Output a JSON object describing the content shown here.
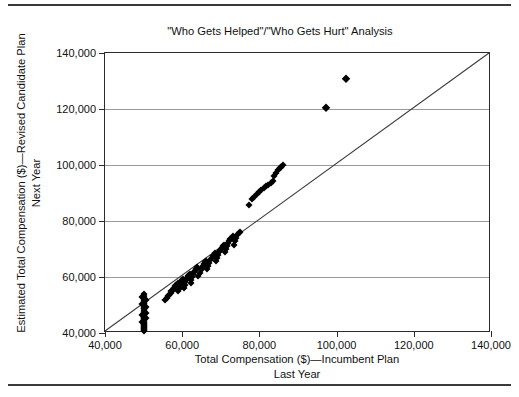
{
  "chart_title": {
    "line1": "\"Who Gets Helped\"/\"Who Gets Hurt\" Analysis",
    "line2": "(Based on the Coming Year's Projected Performance Distribution)"
  },
  "y_axis": {
    "title_line1": "Estimated Total Compensation ($)—Revised Candidate Plan",
    "title_line2": "Next Year",
    "tick_labels": [
      "140,000",
      "120,000",
      "100,000",
      "80,000",
      "60,000",
      "40,000"
    ],
    "min": 40000,
    "max": 140000
  },
  "x_axis": {
    "title_line1": "Total Compensation ($)—Incumbent Plan",
    "title_line2": "Last Year",
    "tick_labels": [
      "40,000",
      "60,000",
      "80,000",
      "100,000",
      "120,000",
      "140,000"
    ],
    "min": 40000,
    "max": 140000
  },
  "colors": {
    "marker": "#000000",
    "axis": "#2b2b2b",
    "gridline": "#9a9a9a",
    "reference_line": "#3a3a3a",
    "rule": "#3a3a3a",
    "background": "#ffffff"
  },
  "chart_data": {
    "type": "scatter",
    "title": "\"Who Gets Helped\"/\"Who Gets Hurt\" Analysis (Based on the Coming Year's Projected Performance Distribution)",
    "xlabel": "Total Compensation ($)—Incumbent Plan Last Year",
    "ylabel": "Estimated Total Compensation ($)—Revised Candidate Plan Next Year",
    "xlim": [
      40000,
      140000
    ],
    "ylim": [
      40000,
      140000
    ],
    "xticks": [
      40000,
      60000,
      80000,
      100000,
      120000,
      140000
    ],
    "yticks": [
      40000,
      60000,
      80000,
      100000,
      120000,
      140000
    ],
    "grid": "horizontal",
    "legend": "none",
    "annotations": [
      {
        "text": "reference line y = x drawn from (40,000, 40,000) to (140,000, 140,000)"
      }
    ],
    "reference_line": {
      "from": [
        40000,
        40000
      ],
      "to": [
        140000,
        140000
      ]
    },
    "series": [
      {
        "name": "Employees",
        "marker": "diamond",
        "points": [
          [
            50000,
            40600
          ],
          [
            50000,
            41000
          ],
          [
            50000,
            41400
          ],
          [
            50000,
            41800
          ],
          [
            50000,
            42100
          ],
          [
            50000,
            42500
          ],
          [
            50000,
            42900
          ],
          [
            50000,
            43300
          ],
          [
            50000,
            43700
          ],
          [
            50000,
            44100
          ],
          [
            50000,
            44500
          ],
          [
            50000,
            45000
          ],
          [
            50000,
            45400
          ],
          [
            50000,
            45800
          ],
          [
            50000,
            46300
          ],
          [
            50000,
            46800
          ],
          [
            50000,
            47300
          ],
          [
            50000,
            47900
          ],
          [
            50000,
            48400
          ],
          [
            50000,
            49000
          ],
          [
            50000,
            49600
          ],
          [
            50000,
            50200
          ],
          [
            50000,
            50800
          ],
          [
            50000,
            51400
          ],
          [
            50000,
            52000
          ],
          [
            50000,
            52600
          ],
          [
            50000,
            53200
          ],
          [
            50000,
            53800
          ],
          [
            50500,
            45200
          ],
          [
            50500,
            47000
          ],
          [
            50500,
            49400
          ],
          [
            50500,
            51800
          ],
          [
            49600,
            44000
          ],
          [
            49600,
            46500
          ],
          [
            49600,
            50500
          ],
          [
            49600,
            52800
          ],
          [
            55500,
            51800
          ],
          [
            56000,
            52600
          ],
          [
            56300,
            53100
          ],
          [
            56600,
            53600
          ],
          [
            57000,
            54300
          ],
          [
            57200,
            55000
          ],
          [
            57500,
            55500
          ],
          [
            57800,
            56000
          ],
          [
            58200,
            56700
          ],
          [
            58500,
            57300
          ],
          [
            58800,
            57800
          ],
          [
            59000,
            54900
          ],
          [
            59200,
            55800
          ],
          [
            59400,
            56600
          ],
          [
            59600,
            57500
          ],
          [
            59800,
            58300
          ],
          [
            60000,
            58900
          ],
          [
            60200,
            59400
          ],
          [
            60400,
            56200
          ],
          [
            60600,
            57100
          ],
          [
            60800,
            58200
          ],
          [
            61000,
            59000
          ],
          [
            61200,
            59600
          ],
          [
            61400,
            60200
          ],
          [
            61700,
            60700
          ],
          [
            62000,
            61200
          ],
          [
            62200,
            58000
          ],
          [
            62400,
            59100
          ],
          [
            62600,
            60100
          ],
          [
            62800,
            61000
          ],
          [
            63000,
            61700
          ],
          [
            63300,
            62300
          ],
          [
            63600,
            62900
          ],
          [
            63900,
            63400
          ],
          [
            64200,
            60200
          ],
          [
            64500,
            61400
          ],
          [
            64800,
            62400
          ],
          [
            65000,
            63200
          ],
          [
            65300,
            63900
          ],
          [
            65600,
            64600
          ],
          [
            65900,
            65200
          ],
          [
            66200,
            65800
          ],
          [
            66500,
            62800
          ],
          [
            66800,
            64000
          ],
          [
            67000,
            65000
          ],
          [
            67300,
            65900
          ],
          [
            67600,
            66700
          ],
          [
            67900,
            67400
          ],
          [
            68200,
            68000
          ],
          [
            68500,
            68600
          ],
          [
            68800,
            65600
          ],
          [
            69000,
            66800
          ],
          [
            69300,
            67900
          ],
          [
            69600,
            68800
          ],
          [
            69900,
            69600
          ],
          [
            70200,
            70300
          ],
          [
            70500,
            70900
          ],
          [
            70800,
            71500
          ],
          [
            71000,
            68800
          ],
          [
            71300,
            70000
          ],
          [
            71600,
            71100
          ],
          [
            71900,
            72000
          ],
          [
            72200,
            72800
          ],
          [
            72500,
            73400
          ],
          [
            72800,
            74000
          ],
          [
            73100,
            74500
          ],
          [
            73400,
            71600
          ],
          [
            73700,
            72900
          ],
          [
            74000,
            74000
          ],
          [
            74300,
            74900
          ],
          [
            74600,
            75600
          ],
          [
            74900,
            76200
          ],
          [
            77300,
            85800
          ],
          [
            78200,
            87800
          ],
          [
            78700,
            88700
          ],
          [
            79300,
            89600
          ],
          [
            79900,
            90400
          ],
          [
            80500,
            91100
          ],
          [
            81100,
            91800
          ],
          [
            81700,
            92400
          ],
          [
            82300,
            93000
          ],
          [
            82900,
            93600
          ],
          [
            83500,
            94200
          ],
          [
            83900,
            96100
          ],
          [
            84400,
            97200
          ],
          [
            84900,
            98100
          ],
          [
            85300,
            98800
          ],
          [
            85700,
            99400
          ],
          [
            86100,
            99900
          ],
          [
            97300,
            120400
          ],
          [
            102400,
            130600
          ]
        ]
      }
    ]
  }
}
